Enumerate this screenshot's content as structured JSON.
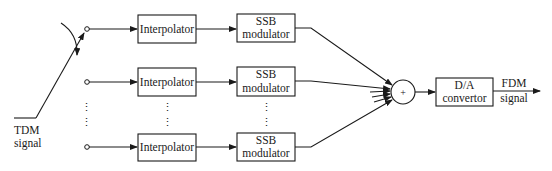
{
  "diagram": {
    "input": {
      "label_line1": "TDM",
      "label_line2": "signal"
    },
    "rows": [
      {
        "interpolator": "Interpolator",
        "modulator_line1": "SSB",
        "modulator_line2": "modulator"
      },
      {
        "interpolator": "Interpolator",
        "modulator_line1": "SSB",
        "modulator_line2": "modulator"
      },
      {
        "interpolator": "Interpolator",
        "modulator_line1": "SSB",
        "modulator_line2": "modulator"
      }
    ],
    "ellipsis": "⋮",
    "summer": {
      "symbol": "+"
    },
    "converter": {
      "label_line1": "D/A",
      "label_line2": "convertor"
    },
    "output": {
      "label_line1": "FDM",
      "label_line2": "signal"
    }
  }
}
